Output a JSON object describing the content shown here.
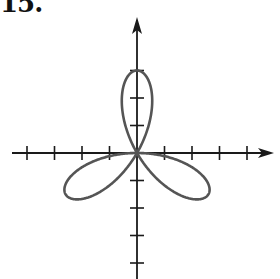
{
  "problem_label": "15.",
  "colors": {
    "axis": "#1a1a1a",
    "curve": "#555555",
    "background": "#ffffff"
  },
  "chart_data": {
    "type": "line",
    "title": "",
    "equation_inferred": "r = -3 sin(3θ)",
    "petals": 3,
    "petal_length": 3,
    "petal_directions_deg": [
      30,
      150,
      270
    ],
    "xlabel": "",
    "ylabel": "",
    "xlim": [
      -4.5,
      5
    ],
    "ylim": [
      -4.3,
      5
    ],
    "x_ticks": [
      -4,
      -3,
      -2,
      -1,
      1,
      2,
      3,
      4
    ],
    "y_ticks": [
      -4,
      -3,
      -2,
      -1,
      1,
      2,
      3
    ],
    "tick_labels_visible": false,
    "grid": false,
    "legend": null
  }
}
